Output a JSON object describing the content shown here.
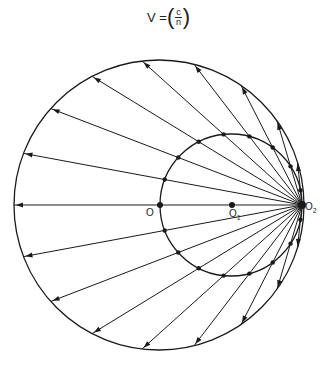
{
  "formula": {
    "lhs": "V =",
    "numerator": "c",
    "denominator": "n"
  },
  "labels": {
    "O": "O",
    "O1": "O",
    "O1_sub": "1",
    "O2": "O",
    "O2_sub": "2"
  },
  "geometry": {
    "big_circle": {
      "cx": 159,
      "cy": 205,
      "r": 145
    },
    "small_circle": {
      "cx": 231,
      "cy": 205,
      "r": 71
    },
    "O": [
      160,
      205
    ],
    "O1": [
      232,
      205
    ],
    "O2": [
      302,
      205
    ],
    "ray_angle_step_deg": 10.5,
    "ray_count_each_side": 8
  },
  "colors": {
    "stroke": "#1a1a1a"
  }
}
